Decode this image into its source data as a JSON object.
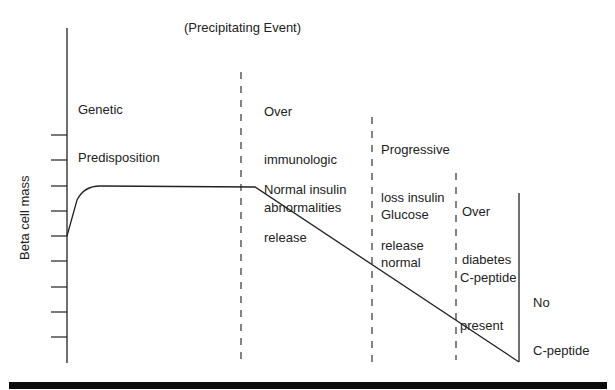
{
  "diagram": {
    "title": "(Precipitating Event)",
    "y_axis_label": "Beta cell mass",
    "stages": [
      {
        "id": "genetic",
        "lines": [
          "Genetic",
          "Predisposition"
        ]
      },
      {
        "id": "immunologic",
        "lines": [
          "Over",
          "immunologic",
          "abnormalities"
        ]
      },
      {
        "id": "normal-insulin",
        "lines": [
          "Normal insulin",
          "release"
        ]
      },
      {
        "id": "progressive-loss",
        "lines": [
          "Progressive",
          "loss insulin",
          "release"
        ]
      },
      {
        "id": "glucose-normal",
        "lines": [
          "Glucose",
          "normal"
        ]
      },
      {
        "id": "overt-diabetes",
        "lines": [
          "Over",
          "diabetes"
        ]
      },
      {
        "id": "c-peptide-present",
        "lines": [
          "C-peptide",
          "present"
        ]
      },
      {
        "id": "no-c-peptide",
        "lines": [
          "No",
          "C-peptide"
        ]
      }
    ],
    "y_axis_ticks": 9,
    "line_color": "#222222",
    "footer_bar_color": "#0c0c0c"
  }
}
